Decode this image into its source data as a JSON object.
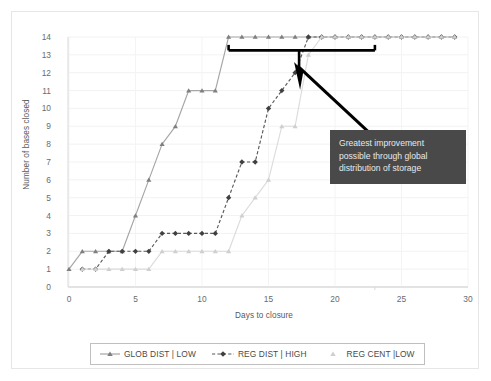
{
  "chart_data": {
    "type": "line",
    "title": "",
    "xlabel": "Days to closure",
    "ylabel": "Number of bases closed",
    "xlim": [
      0,
      30
    ],
    "ylim": [
      0,
      14
    ],
    "xticks": [
      0,
      5,
      10,
      15,
      20,
      25,
      30
    ],
    "yticks": [
      0,
      1,
      2,
      3,
      4,
      5,
      6,
      7,
      8,
      9,
      10,
      11,
      12,
      13,
      14
    ],
    "grid": "horizontal-and-vertical-light",
    "legend_position": "bottom",
    "x": [
      0,
      1,
      2,
      3,
      4,
      5,
      6,
      7,
      8,
      9,
      10,
      11,
      12,
      13,
      14,
      15,
      16,
      17,
      18,
      19,
      20,
      21,
      22,
      23,
      24,
      25,
      26,
      27,
      28,
      29
    ],
    "series": [
      {
        "name": "GLOB DIST | LOW",
        "marker": "triangle",
        "line": "solid",
        "color": "#a6a6a6",
        "marker_color": "#7f7f7f",
        "values": [
          1,
          2,
          2,
          2,
          2,
          4,
          6,
          8,
          9,
          11,
          11,
          11,
          14,
          14,
          14,
          14,
          14,
          14,
          14,
          14,
          14,
          14,
          14,
          14,
          14,
          14,
          14,
          14,
          14,
          14
        ]
      },
      {
        "name": "REG DIST | HIGH",
        "marker": "diamond",
        "line": "dashed",
        "color": "#595959",
        "marker_color": "#404040",
        "values": [
          null,
          1,
          1,
          2,
          2,
          2,
          2,
          3,
          3,
          3,
          3,
          3,
          5,
          7,
          7,
          10,
          11,
          12,
          14,
          14,
          14,
          14,
          14,
          14,
          14,
          14,
          14,
          14,
          14,
          14
        ]
      },
      {
        "name": "REG CENT |LOW",
        "marker": "triangle",
        "line": "solid",
        "color": "#dcdcdc",
        "marker_color": "#cfcfcf",
        "values": [
          null,
          1,
          1,
          1,
          1,
          1,
          1,
          2,
          2,
          2,
          2,
          2,
          2,
          4,
          5,
          6,
          9,
          9,
          13,
          14,
          14,
          14,
          14,
          14,
          14,
          14,
          14,
          14,
          14,
          14
        ]
      }
    ],
    "annotations": [
      {
        "type": "bracket",
        "x_start": 12,
        "x_end": 23,
        "y": 13.25,
        "color": "#000000"
      },
      {
        "type": "callout",
        "text_lines": [
          "Greatest improvement",
          "possible through global",
          "distribution of storage"
        ],
        "background": "#494949",
        "text_color": "#e8e8e8",
        "leader_color": "#000000"
      }
    ]
  },
  "axes": {
    "ylabel": "Number of bases closed",
    "xlabel": "Days to closure",
    "ytick_labels": [
      "14",
      "13",
      "12",
      "11",
      "10",
      "9",
      "8",
      "7",
      "6",
      "5",
      "4",
      "3",
      "2",
      "1",
      "0"
    ],
    "xtick_labels": [
      "0",
      "5",
      "10",
      "15",
      "20",
      "25",
      "30"
    ]
  },
  "legend": {
    "items": [
      {
        "label": "GLOB DIST | LOW",
        "marker": "triangle",
        "line": "solid"
      },
      {
        "label": "REG DIST | HIGH",
        "marker": "diamond",
        "line": "dashed"
      },
      {
        "label": "REG CENT |LOW",
        "marker": "triangle",
        "line": "solid"
      }
    ]
  },
  "callout": {
    "line1": "Greatest improvement",
    "line2": "possible through global",
    "line3": "distribution of storage"
  }
}
